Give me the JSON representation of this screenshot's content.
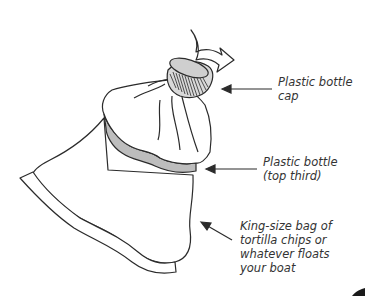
{
  "diagram": {
    "type": "labeled-illustration",
    "labels": {
      "cap": {
        "line1": "Plastic bottle",
        "line2": "cap"
      },
      "bottle_top": {
        "line1": "Plastic bottle",
        "line2": "(top third)"
      },
      "bag": {
        "line1": "King-size bag of",
        "line2": "tortilla chips or",
        "line3": "whatever floats",
        "line4": "your boat"
      }
    },
    "icons": {
      "twist_arrow": "curved-arrow-icon"
    },
    "colors": {
      "stroke": "#2b2b2b",
      "bottle_fill": "#bdbdbd",
      "cap_fill": "#d9d9d9",
      "text": "#333333",
      "background": "#ffffff"
    }
  }
}
